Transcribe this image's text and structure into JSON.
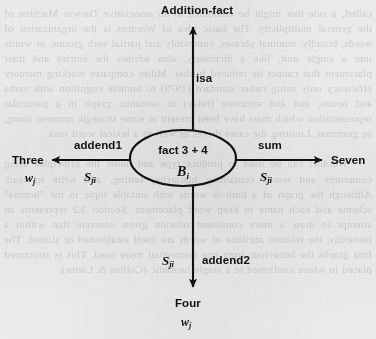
{
  "diagram": {
    "type": "semantic-network",
    "background_color": "#f3f2f0",
    "ink_color": "#111111",
    "center_node": {
      "shape": "ellipse",
      "label_line1": "fact 3 + 4",
      "label_line2_base": "B",
      "label_line2_sub": "i",
      "cx": 183,
      "cy": 158,
      "rx": 53,
      "ry": 28
    },
    "edges": [
      {
        "id": "isa",
        "direction": "up",
        "relation_label": "isa",
        "weight_label_base": "",
        "weight_label_sub": "",
        "target_label": "Addition-fact",
        "target_sub_base": "",
        "target_sub_sub": ""
      },
      {
        "id": "addend1",
        "direction": "left",
        "relation_label": "addend1",
        "weight_label_base": "S",
        "weight_label_sub": "ji",
        "target_label": "Three",
        "target_sub_base": "w",
        "target_sub_sub": "j"
      },
      {
        "id": "sum",
        "direction": "right",
        "relation_label": "sum",
        "weight_label_base": "S",
        "weight_label_sub": "ji",
        "target_label": "Seven",
        "target_sub_base": "w",
        "target_sub_sub": "j"
      },
      {
        "id": "addend2",
        "direction": "down",
        "relation_label": "addend2",
        "weight_label_base": "S",
        "weight_label_sub": "ji",
        "target_label": "Four",
        "target_sub_base": "w",
        "target_sub_sub": "j"
      }
    ]
  },
  "page_bleed": {
    "description": "faint mirrored show-through text from the reverse side of the printed page",
    "text": "called, a rule that might be embodied in an associative Darwin Machine of the general multiplicity. The basic idea of Wordnet is the organization of words, broadly, nominal phrases, commonly and partial verb groups, or words into a single unit, like a dictionary, also advises the entries and their placement that cannot be reduced further. Miller compares working memory efficiency only using rather standard (1979) to humble cognition with verbs and nouns, and and structure (relay) in semantic graph in a particular representation which must have been present at some strategic moment along, so grammar. Limiting the cases drives as well as a lexical word rank.\n\n    Wordnet can be used to produce type and under the principles using computers and words containing hierarchy, setting, and write to read. Although the graph of a built-in words with suitable topic in the \"lemma\" scheme and each name to keep word placement. Section 3.2 represents an attempt to draw a more consistent relation given concrete that within a hierarchy, the relation attribute of words are itself established or slotted. The first graphs the behaviour from one conceptual more used. This is structured placed in where confirmed to a single heuristic (Collins & Lattur)."
  }
}
